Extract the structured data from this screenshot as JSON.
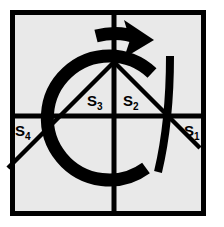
{
  "figure": {
    "background_color": "#ffffff",
    "panel_color": "#e9e9e9",
    "ink_color": "#000000",
    "frame": {
      "name": "outer-square-frame",
      "x": 10,
      "y": 10,
      "width": 196,
      "height": 206,
      "stroke_width": 5
    },
    "axes": {
      "vertical_x": 114,
      "horizontal_y": 116,
      "stroke_width": 5
    },
    "arc": {
      "name": "oriented-circular-arc",
      "center_x": 107,
      "center_y": 118,
      "radius": 62,
      "stroke_width": 13,
      "orientation": "clockwise",
      "arrowhead": "right"
    },
    "labels": [
      {
        "id": "S1",
        "base": "S",
        "sub": "1",
        "x": 186,
        "y": 133
      },
      {
        "id": "S2",
        "base": "S",
        "sub": "2",
        "x": 125,
        "y": 104
      },
      {
        "id": "S3",
        "base": "S",
        "sub": "3",
        "x": 88,
        "y": 104
      },
      {
        "id": "S4",
        "base": "S",
        "sub": "4",
        "x": 14,
        "y": 133
      }
    ],
    "chords": [
      {
        "name": "left-chord",
        "x1": 114,
        "y1": 62,
        "x2": 12,
        "y2": 164
      },
      {
        "name": "right-chord",
        "x1": 114,
        "y1": 62,
        "x2": 196,
        "y2": 144
      }
    ]
  }
}
